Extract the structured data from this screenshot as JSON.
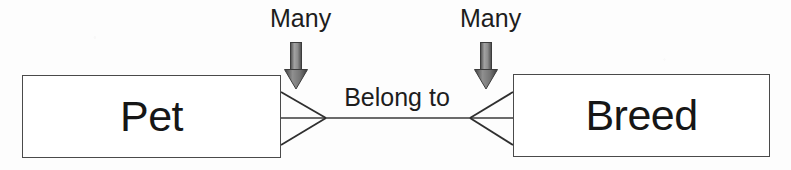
{
  "diagram": {
    "type": "entity-relationship-diagram",
    "notation": "crow's foot",
    "background_color": "#fdfdfd",
    "line_color": "#3a3a3a",
    "text_color": "#1d1d1d"
  },
  "entities": [
    {
      "name": "Pet",
      "label": "Pet"
    },
    {
      "name": "Breed",
      "label": "Breed"
    }
  ],
  "relationship": {
    "label": "Belong to",
    "left_cardinality": "Many",
    "right_cardinality": "Many"
  },
  "annotations": [
    {
      "label": "Many",
      "points_to": "left-crows-foot",
      "icon": "down-arrow-icon"
    },
    {
      "label": "Many",
      "points_to": "right-crows-foot",
      "icon": "down-arrow-icon"
    }
  ],
  "arrow_style": {
    "fill_light": "#9a9a9a",
    "fill_dark": "#4d4d4d",
    "outline": "#3c3c3c"
  }
}
